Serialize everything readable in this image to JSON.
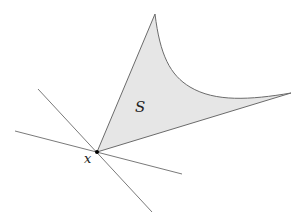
{
  "diagram": {
    "region": {
      "label": "S",
      "fill": "#e6e6e6",
      "stroke": "#6b6b6b"
    },
    "point": {
      "label": "x",
      "color": "#000000"
    },
    "lines": {
      "stroke": "#7a7a7a",
      "count": 2
    }
  }
}
